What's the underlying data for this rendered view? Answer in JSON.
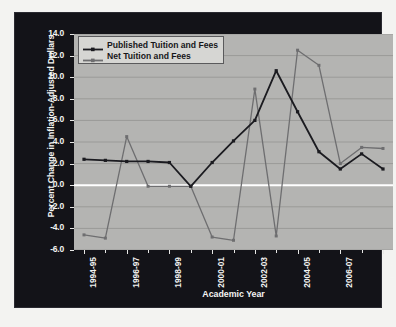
{
  "chart_data": {
    "type": "line",
    "title": "",
    "xlabel": "Academic Year",
    "ylabel": "Percent Change in Inflation-Adjusted Dollars",
    "categories": [
      "1994-95",
      "1995-96",
      "1996-97",
      "1997-98",
      "1998-99",
      "1999-00",
      "2000-01",
      "2001-02",
      "2002-03",
      "2003-04",
      "2004-05",
      "2005-06",
      "2006-07",
      "2007-08",
      "2008-09"
    ],
    "tick_labels": [
      "1994-95",
      "1996-97",
      "1998-99",
      "2000-01",
      "2002-03",
      "2004-05",
      "2006-07",
      "2008-09"
    ],
    "tick_indices": [
      0,
      2,
      4,
      6,
      8,
      10,
      12,
      14
    ],
    "ylim": [
      -6.0,
      14.0
    ],
    "ystep": 2.0,
    "ytick_labels": [
      "14.0",
      "12.0",
      "10.0",
      "8.0",
      "6.0",
      "4.0",
      "2.0",
      "0.0",
      "-2.0",
      "-4.0",
      "-6.0"
    ],
    "ytick_values": [
      14.0,
      12.0,
      10.0,
      8.0,
      6.0,
      4.0,
      2.0,
      0.0,
      -2.0,
      -4.0,
      -6.0
    ],
    "grid": true,
    "legend_position": "top-left",
    "series": [
      {
        "name": "Published Tuition and Fees",
        "color": "#1b1b20",
        "marker": "square",
        "values": [
          2.4,
          2.3,
          2.2,
          2.2,
          2.1,
          -0.1,
          2.1,
          4.1,
          6.0,
          10.6,
          6.8,
          3.1,
          1.5,
          2.9,
          1.5
        ]
      },
      {
        "name": "Net Tuition and Fees",
        "color": "#6e6e70",
        "marker": "square",
        "values": [
          -4.6,
          -4.9,
          4.5,
          -0.1,
          -0.1,
          -0.1,
          -4.8,
          -5.1,
          8.9,
          -4.7,
          12.5,
          11.1,
          2.0,
          3.5,
          3.4
        ]
      }
    ]
  },
  "colors": {
    "frame_background": "#131318",
    "plot_background": "#b4b4b2",
    "gridline": "#9a9a98",
    "zero_line": "#ffffff",
    "axis_text": "#f4f4f2",
    "published_series": "#1b1b20",
    "net_series": "#6e6e70",
    "legend_background": "#d6d6d3",
    "legend_border": "#5a5a5c"
  }
}
